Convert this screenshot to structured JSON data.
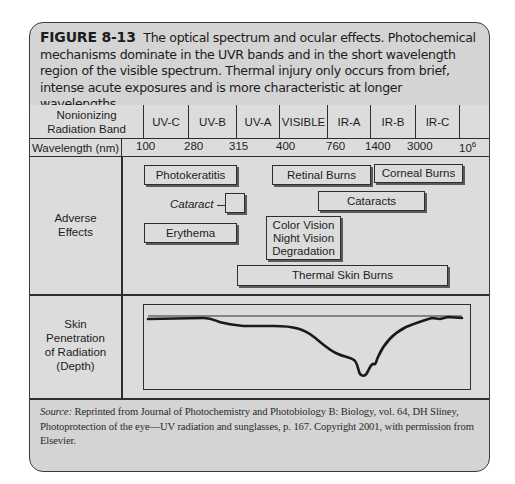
{
  "figure": {
    "label": "FIGURE 8-13",
    "caption": "The optical spectrum and ocular effects. Photochemical mechanisms dominate in the UVR bands and in the short wavelength region of the visible spectrum. Thermal injury only occurs from brief, intense acute exposures and is more characteristic at longer wavelengths."
  },
  "table": {
    "band_row": {
      "header_line1": "Nonionizing",
      "header_line2": "Radiation Band",
      "bands": [
        "UV-C",
        "UV-B",
        "UV-A",
        "VISIBLE",
        "IR-A",
        "IR-B",
        "IR-C",
        ""
      ]
    },
    "wavelength_row": {
      "header": "Wavelength (nm)",
      "values": [
        "100",
        "280",
        "315",
        "400",
        "760",
        "1400",
        "3000"
      ],
      "last_base": "10",
      "last_exp": "6"
    },
    "effects_row": {
      "header_line1": "Adverse",
      "header_line2": "Effects",
      "effects": {
        "photokeratitis": "Photokeratitis",
        "retinal_burns": "Retinal Burns",
        "corneal_burns": "Corneal Burns",
        "cataract_uv": "Cataract",
        "cataracts_ir": "Cataracts",
        "erythema": "Erythema",
        "color_vision": "Color Vision",
        "night_vision": "Night Vision",
        "degradation": "Degradation",
        "thermal_skin_burns": "Thermal Skin Burns"
      }
    },
    "skin_row": {
      "line1": "Skin",
      "line2": "Penetration",
      "line3": "of Radiation",
      "line4": "(Depth)"
    }
  },
  "source": {
    "label": "Source:",
    "text": "Reprinted from Journal of Photochemistry and Photobiology B: Biology, vol. 64, DH Sliney, Photoprotection of the eye—UV radiation and sunglasses, p. 167. Copyright 2001, with permission from Elsevier."
  }
}
